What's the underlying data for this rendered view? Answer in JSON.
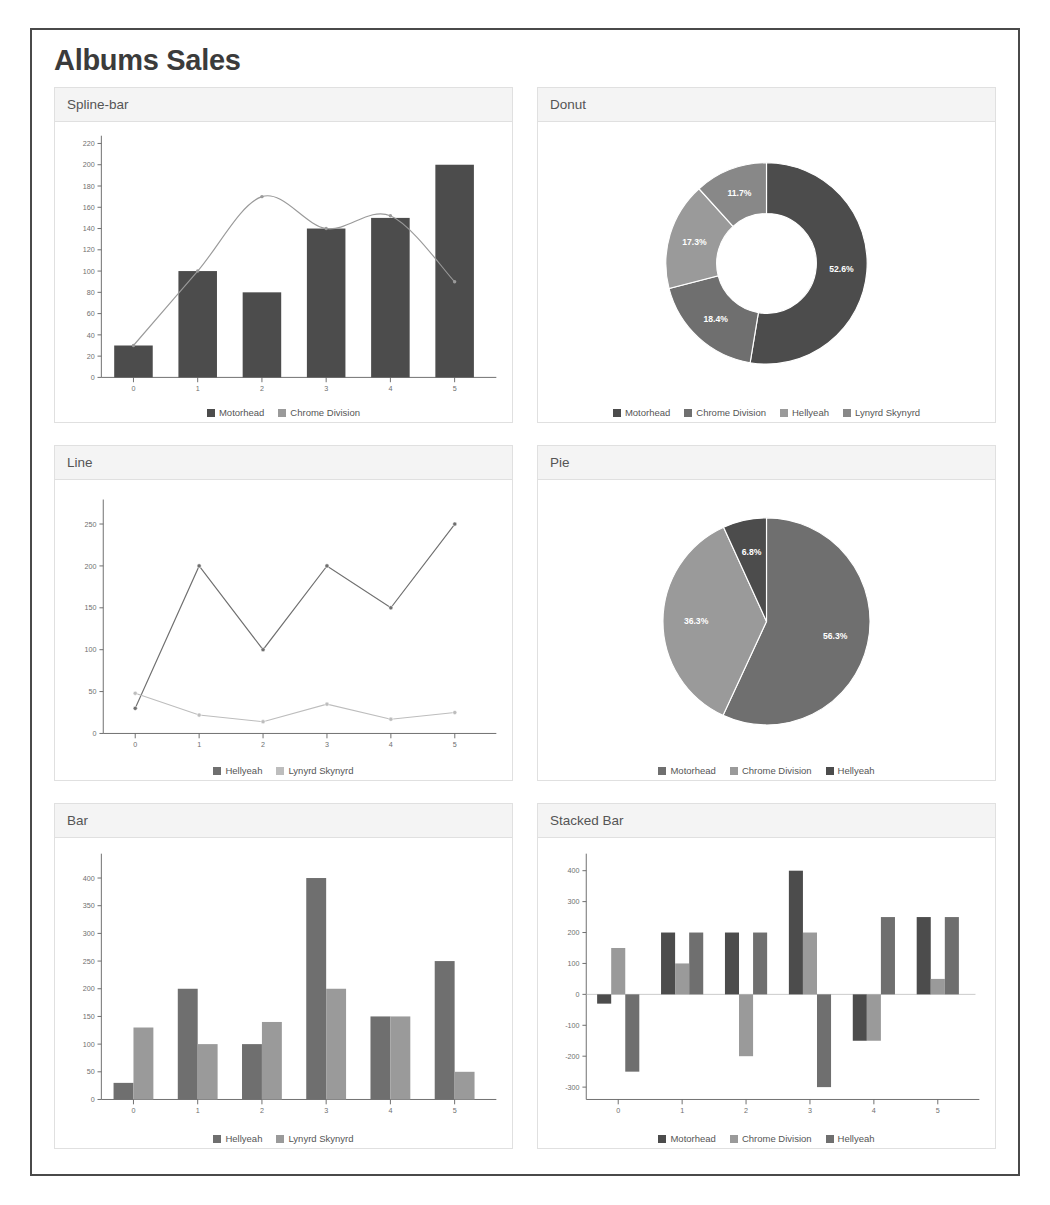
{
  "page": {
    "title": "Albums Sales"
  },
  "colors": {
    "motorhead": "#4c4c4c",
    "chrome_division": "#9a9a9a",
    "hellyeah": "#6f6f6f",
    "lynyrd_skynyrd": "#bdbdbd",
    "panel_header_bg": "#f4f4f4",
    "panel_border": "#e0e0e0",
    "frame_border": "#4a4a4a",
    "axis": "#6b6b6b",
    "text": "#555555"
  },
  "panels": [
    {
      "title": "Spline-bar"
    },
    {
      "title": "Donut"
    },
    {
      "title": "Line"
    },
    {
      "title": "Pie"
    },
    {
      "title": "Bar"
    },
    {
      "title": "Stacked Bar"
    }
  ],
  "chart_data": [
    {
      "id": "spline-bar",
      "type": "bar",
      "title": "Spline-bar",
      "categories": [
        "0",
        "1",
        "2",
        "3",
        "4",
        "5"
      ],
      "xlabel": "",
      "ylabel": "",
      "ylim": [
        0,
        220
      ],
      "yticks": [
        0,
        20,
        40,
        60,
        80,
        100,
        120,
        140,
        160,
        180,
        200,
        220
      ],
      "grid": false,
      "legend_position": "bottom",
      "series": [
        {
          "name": "Motorhead",
          "render": "bar",
          "color": "#4c4c4c",
          "values": [
            30,
            100,
            80,
            140,
            150,
            200
          ]
        },
        {
          "name": "Chrome Division",
          "render": "spline",
          "color": "#9a9a9a",
          "values": [
            30,
            100,
            170,
            140,
            152,
            90
          ]
        }
      ]
    },
    {
      "id": "donut",
      "type": "pie",
      "variant": "donut",
      "title": "Donut",
      "legend_position": "bottom",
      "labels": [
        "Motorhead",
        "Chrome Division",
        "Hellyeah",
        "Lynyrd Skynyrd"
      ],
      "percents": [
        52.6,
        18.4,
        17.3,
        11.7
      ],
      "slice_labels": [
        "52.6%",
        "18.4%",
        "17.3%",
        "11.7%"
      ],
      "colors": [
        "#4c4c4c",
        "#6f6f6f",
        "#9a9a9a",
        "#888888"
      ]
    },
    {
      "id": "line",
      "type": "line",
      "title": "Line",
      "categories": [
        "0",
        "1",
        "2",
        "3",
        "4",
        "5"
      ],
      "ylim": [
        0,
        270
      ],
      "yticks": [
        0,
        50,
        100,
        150,
        200,
        250
      ],
      "grid": false,
      "legend_position": "bottom",
      "series": [
        {
          "name": "Hellyeah",
          "color": "#6f6f6f",
          "values": [
            30,
            200,
            100,
            200,
            150,
            250
          ]
        },
        {
          "name": "Lynyrd Skynyrd",
          "color": "#bdbdbd",
          "values": [
            48,
            22,
            14,
            35,
            17,
            25
          ]
        }
      ]
    },
    {
      "id": "pie",
      "type": "pie",
      "variant": "pie",
      "title": "Pie",
      "legend_position": "bottom",
      "labels": [
        "Motorhead",
        "Chrome Division",
        "Hellyeah"
      ],
      "percents": [
        56.9,
        36.3,
        6.8
      ],
      "slice_labels": [
        "56.3%",
        "36.3%",
        "6.8%"
      ],
      "colors": [
        "#6f6f6f",
        "#9a9a9a",
        "#4c4c4c"
      ]
    },
    {
      "id": "bar",
      "type": "bar",
      "title": "Bar",
      "categories": [
        "0",
        "1",
        "2",
        "3",
        "4",
        "5"
      ],
      "ylim": [
        0,
        430
      ],
      "yticks": [
        0,
        50,
        100,
        150,
        200,
        250,
        300,
        350,
        400
      ],
      "grid": false,
      "legend_position": "bottom",
      "series": [
        {
          "name": "Hellyeah",
          "color": "#6f6f6f",
          "values": [
            30,
            200,
            100,
            400,
            150,
            250
          ]
        },
        {
          "name": "Lynyrd Skynyrd",
          "color": "#9a9a9a",
          "values": [
            130,
            100,
            140,
            200,
            150,
            50
          ]
        }
      ]
    },
    {
      "id": "stacked-bar",
      "type": "bar",
      "variant": "grouped-signed",
      "title": "Stacked Bar",
      "categories": [
        "0",
        "1",
        "2",
        "3",
        "4",
        "5"
      ],
      "ylim": [
        -340,
        430
      ],
      "yticks": [
        400,
        300,
        200,
        100,
        0,
        -100,
        -200,
        -300
      ],
      "grid": false,
      "legend_position": "bottom",
      "series": [
        {
          "name": "Motorhead",
          "color": "#4c4c4c",
          "values": [
            -30,
            200,
            200,
            400,
            -150,
            250
          ]
        },
        {
          "name": "Chrome Division",
          "color": "#9a9a9a",
          "values": [
            150,
            100,
            -200,
            200,
            -150,
            50
          ]
        },
        {
          "name": "Hellyeah",
          "color": "#6f6f6f",
          "values": [
            -250,
            200,
            200,
            -300,
            250,
            250
          ]
        }
      ]
    }
  ]
}
